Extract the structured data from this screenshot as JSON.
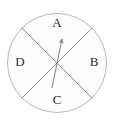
{
  "figure": {
    "name": "spinner-wheel",
    "type": "four-sector-spinner",
    "background_color": "#ffffff"
  },
  "circle": {
    "center_x": 57,
    "center_y": 63,
    "radius": 50,
    "stroke_color": "#b7b7b7",
    "fill_color": "#fdfdfd",
    "stroke_width": 1
  },
  "dividers": {
    "stroke_color": "#8f8f8f",
    "stroke_width": 1,
    "angles_deg": [
      45,
      135
    ],
    "count": 2
  },
  "sectors": [
    {
      "id": "A",
      "label": "A",
      "position": "top",
      "label_x": 57,
      "label_y": 24
    },
    {
      "id": "B",
      "label": "B",
      "position": "right",
      "label_x": 94,
      "label_y": 63
    },
    {
      "id": "C",
      "label": "C",
      "position": "bottom",
      "label_x": 57,
      "label_y": 101
    },
    {
      "id": "D",
      "label": "D",
      "position": "left",
      "label_x": 20,
      "label_y": 63
    }
  ],
  "pointer": {
    "name": "spinner-arrow",
    "stroke_color": "#8a8a8a",
    "stroke_width": 1,
    "tail_x": 52,
    "tail_y": 88,
    "tip_x": 62,
    "tip_y": 37,
    "pivot_x": 57,
    "pivot_y": 63,
    "points_to_sector": "A",
    "arrowhead_color": "#8a8a8a"
  }
}
